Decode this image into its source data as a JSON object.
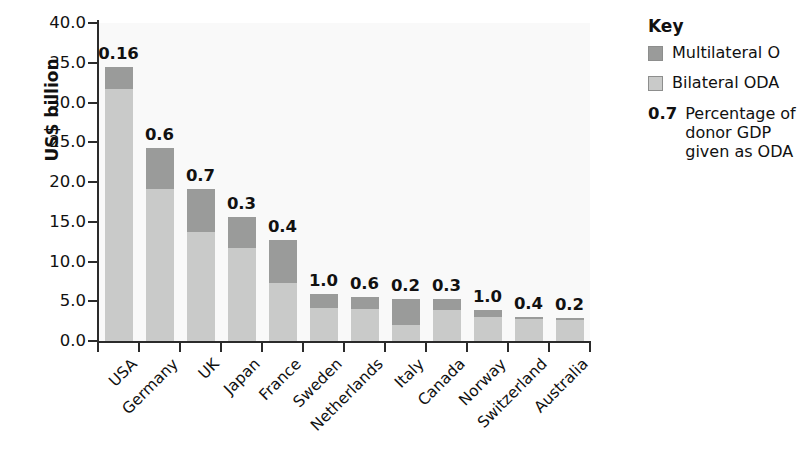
{
  "chart_data": {
    "type": "bar",
    "title": "",
    "subtitle": "",
    "xlabel": "",
    "ylabel": "US$ billion",
    "ylim": [
      0,
      40
    ],
    "ytick_labels": [
      "40.0",
      "35.0",
      "30.0",
      "25.0",
      "20.0",
      "15.0",
      "10.0",
      "5.0",
      "0.0"
    ],
    "ytick_values": [
      40,
      35,
      30,
      25,
      20,
      15,
      10,
      5,
      0
    ],
    "grid": false,
    "stacked": true,
    "legend_position": "right",
    "categories": [
      "USA",
      "Germany",
      "UK",
      "Japan",
      "France",
      "Sweden",
      "Netherlands",
      "Italy",
      "Canada",
      "Norway",
      "Switzerland",
      "Australia"
    ],
    "series": [
      {
        "name": "Bilateral ODA",
        "color": "#c9cac9",
        "values": [
          31.7,
          19.1,
          13.7,
          11.7,
          7.3,
          4.2,
          4.0,
          2.0,
          3.9,
          3.0,
          2.8,
          2.6
        ]
      },
      {
        "name": "Multilateral ODA",
        "color": "#9a9b9a",
        "values": [
          2.8,
          5.2,
          5.4,
          3.9,
          5.4,
          1.7,
          1.5,
          3.3,
          1.4,
          0.9,
          0.2,
          0.3
        ]
      }
    ],
    "totals": [
      34.5,
      24.3,
      19.1,
      15.6,
      12.7,
      5.9,
      5.5,
      5.3,
      5.3,
      3.9,
      3.0,
      2.9
    ],
    "data_labels": [
      "0.16",
      "0.6",
      "0.7",
      "0.3",
      "0.4",
      "1.0",
      "0.6",
      "0.2",
      "0.3",
      "1.0",
      "0.4",
      "0.2"
    ],
    "data_label_meaning": "Percentage of donor GDP given as ODA"
  },
  "legend": {
    "title": "Key",
    "items": [
      {
        "swatch": "dark",
        "label": "Multilateral O"
      },
      {
        "swatch": "light",
        "label": "Bilateral ODA"
      }
    ],
    "note_number": "0.7",
    "note_line1": "Percentage of",
    "note_line2": "donor GDP",
    "note_line3": "given as ODA"
  }
}
